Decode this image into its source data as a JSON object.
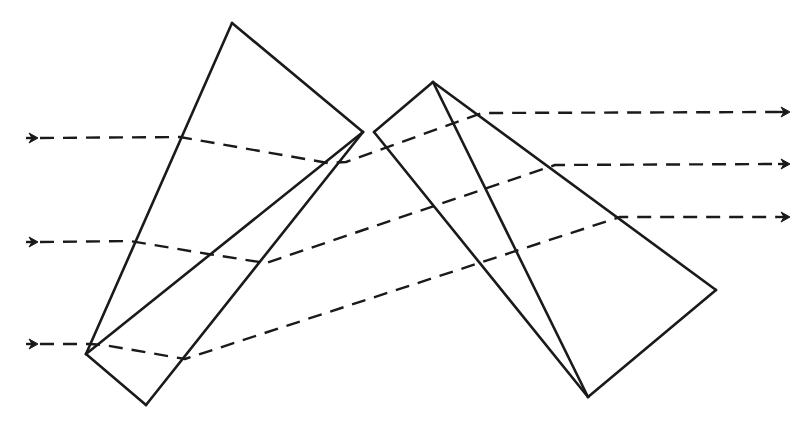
{
  "diagram": {
    "type": "optical-ray-diagram",
    "colors": {
      "line": "#1a1a1a",
      "background": "#ffffff"
    },
    "prism_assemblies": [
      {
        "name": "left-prism-assembly",
        "vertices": {
          "apex": [
            232,
            23
          ],
          "right": [
            363,
            132
          ],
          "bottom_left": [
            86,
            354
          ],
          "bottom": [
            146,
            405
          ]
        },
        "edges": [
          [
            "apex",
            "right"
          ],
          [
            "right",
            "bottom"
          ],
          [
            "bottom",
            "bottom_left"
          ],
          [
            "bottom_left",
            "apex"
          ],
          [
            "right",
            "bottom_left"
          ]
        ]
      },
      {
        "name": "right-prism-assembly",
        "vertices": {
          "apex": [
            433,
            82
          ],
          "left": [
            374,
            132
          ],
          "bottom": [
            588,
            397
          ],
          "right": [
            716,
            290
          ]
        },
        "edges": [
          [
            "left",
            "apex"
          ],
          [
            "apex",
            "right"
          ],
          [
            "right",
            "bottom"
          ],
          [
            "bottom",
            "left"
          ],
          [
            "apex",
            "bottom"
          ]
        ]
      }
    ],
    "rays": [
      {
        "name": "ray-top",
        "points": [
          [
            40,
            138
          ],
          [
            180,
            137
          ],
          [
            328,
            163
          ],
          [
            346,
            162
          ],
          [
            482,
            113
          ],
          [
            778,
            112
          ]
        ],
        "input_arrow": [
          28,
          138
        ],
        "output_arrow": [
          790,
          112
        ]
      },
      {
        "name": "ray-middle",
        "points": [
          [
            40,
            242
          ],
          [
            130,
            241
          ],
          [
            208,
            254
          ],
          [
            266,
            263
          ],
          [
            555,
            165
          ],
          [
            778,
            164
          ]
        ],
        "input_arrow": [
          28,
          242
        ],
        "output_arrow": [
          790,
          164
        ]
      },
      {
        "name": "ray-bottom",
        "points": [
          [
            40,
            344
          ],
          [
            90,
            344
          ],
          [
            104,
            345
          ],
          [
            185,
            359
          ],
          [
            620,
            217
          ],
          [
            778,
            217
          ]
        ],
        "input_arrow": [
          28,
          344
        ],
        "output_arrow": [
          790,
          217
        ]
      }
    ]
  }
}
